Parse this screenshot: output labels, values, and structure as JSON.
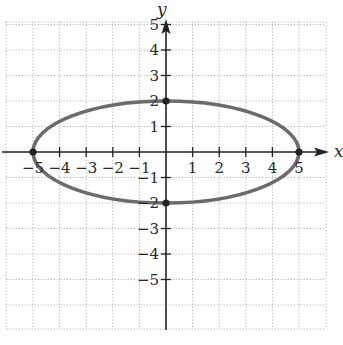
{
  "chart_data": {
    "type": "line",
    "title": "",
    "xlabel": "x",
    "ylabel": "y",
    "xlim": [
      -6,
      6
    ],
    "ylim": [
      -7,
      6
    ],
    "grid": true,
    "grid_style": "dotted",
    "x_ticks": [
      -5,
      -4,
      -3,
      -2,
      -1,
      1,
      2,
      3,
      4,
      5
    ],
    "y_ticks": [
      -5,
      -4,
      -3,
      -2,
      -1,
      1,
      2,
      3,
      4,
      5
    ],
    "x_tick_labels": [
      "−5",
      "−4",
      "−3",
      "−2",
      "−1",
      "1",
      "2",
      "3",
      "4",
      "5"
    ],
    "y_tick_labels": [
      "−5",
      "−4",
      "−3",
      "−2",
      "−1",
      "1",
      "2",
      "3",
      "4",
      "5"
    ],
    "series": [
      {
        "name": "ellipse",
        "equation": "x^2/25 + y^2/4 = 1",
        "center": [
          0,
          0
        ],
        "semi_major_x": 5,
        "semi_minor_y": 2,
        "color": "#6b6b6b"
      }
    ],
    "points": [
      {
        "x": -5,
        "y": 0
      },
      {
        "x": 5,
        "y": 0
      },
      {
        "x": 0,
        "y": 2
      },
      {
        "x": 0,
        "y": -2
      }
    ]
  },
  "colors": {
    "curve": "#6b6b6b",
    "axis": "#222222",
    "grid": "#b0b0b0",
    "point": "#222222"
  },
  "layout": {
    "origin_px": [
      166,
      152
    ],
    "x_unit_px": 26.6,
    "y_unit_px": 25.5,
    "grid_left": 6,
    "grid_right": 326,
    "grid_top": 22,
    "grid_bottom": 329
  }
}
